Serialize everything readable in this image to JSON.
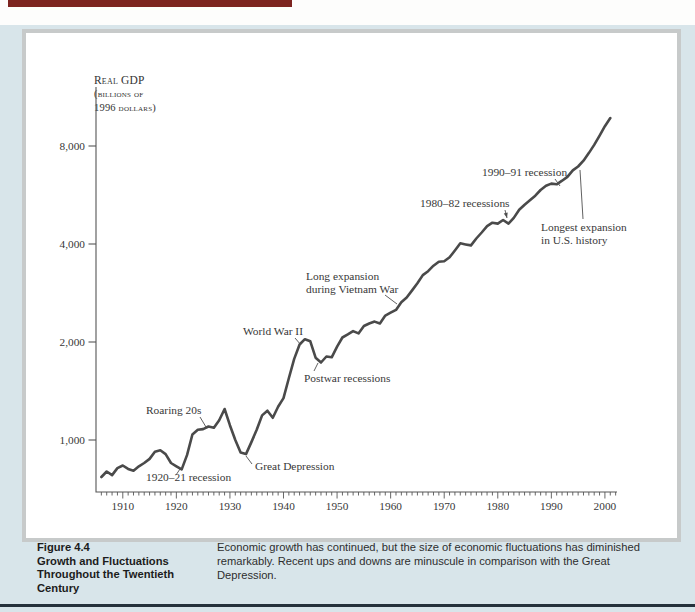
{
  "page": {
    "top_bar_color": "#7d2420",
    "panel_background_color": "#d8e5ea",
    "chart_box_border_color": "#c7caca",
    "bottom_rule_color": "#25313b",
    "curve_color": "#4a4a4a"
  },
  "figure_caption": {
    "label": "Figure 4.4",
    "title_lines": [
      "Growth and Fluctuations",
      "Throughout the Twentieth",
      "Century"
    ],
    "body": "Economic growth has continued, but the size of economic fluctuations has diminished remarkably. Recent ups and downs are minuscule in comparison with the Great Depression."
  },
  "chart_data": {
    "type": "line",
    "ylabel_lines": [
      "Real GDP",
      "(billions of",
      "1996 dollars)"
    ],
    "xlabel": "",
    "y_scale": "log",
    "y_ticks": [
      1000,
      2000,
      4000,
      8000
    ],
    "y_tick_labels": [
      "1,000",
      "2,000",
      "4,000",
      "8,000"
    ],
    "x_ticks": [
      1910,
      1920,
      1930,
      1940,
      1950,
      1960,
      1970,
      1980,
      1990,
      2000
    ],
    "x_range": [
      1905,
      2002
    ],
    "grid": "off",
    "legend": "none",
    "series": [
      {
        "name": "Real GDP (billions of 1996 dollars)",
        "points": [
          [
            1906,
            770
          ],
          [
            1907,
            800
          ],
          [
            1908,
            780
          ],
          [
            1909,
            820
          ],
          [
            1910,
            835
          ],
          [
            1911,
            815
          ],
          [
            1912,
            805
          ],
          [
            1913,
            830
          ],
          [
            1914,
            850
          ],
          [
            1915,
            875
          ],
          [
            1916,
            920
          ],
          [
            1917,
            930
          ],
          [
            1918,
            905
          ],
          [
            1919,
            850
          ],
          [
            1920,
            830
          ],
          [
            1921,
            812
          ],
          [
            1922,
            900
          ],
          [
            1923,
            1040
          ],
          [
            1924,
            1075
          ],
          [
            1925,
            1080
          ],
          [
            1926,
            1100
          ],
          [
            1927,
            1090
          ],
          [
            1928,
            1150
          ],
          [
            1929,
            1245
          ],
          [
            1930,
            1110
          ],
          [
            1931,
            1000
          ],
          [
            1932,
            915
          ],
          [
            1933,
            905
          ],
          [
            1934,
            985
          ],
          [
            1935,
            1075
          ],
          [
            1936,
            1190
          ],
          [
            1937,
            1230
          ],
          [
            1938,
            1170
          ],
          [
            1939,
            1265
          ],
          [
            1940,
            1345
          ],
          [
            1941,
            1550
          ],
          [
            1942,
            1775
          ],
          [
            1943,
            1965
          ],
          [
            1944,
            2040
          ],
          [
            1945,
            2010
          ],
          [
            1946,
            1790
          ],
          [
            1947,
            1730
          ],
          [
            1948,
            1805
          ],
          [
            1949,
            1795
          ],
          [
            1950,
            1935
          ],
          [
            1951,
            2065
          ],
          [
            1952,
            2110
          ],
          [
            1953,
            2160
          ],
          [
            1954,
            2125
          ],
          [
            1955,
            2240
          ],
          [
            1956,
            2280
          ],
          [
            1957,
            2310
          ],
          [
            1958,
            2280
          ],
          [
            1959,
            2410
          ],
          [
            1960,
            2460
          ],
          [
            1961,
            2510
          ],
          [
            1962,
            2650
          ],
          [
            1963,
            2740
          ],
          [
            1964,
            2880
          ],
          [
            1965,
            3030
          ],
          [
            1966,
            3210
          ],
          [
            1967,
            3300
          ],
          [
            1968,
            3430
          ],
          [
            1969,
            3530
          ],
          [
            1970,
            3540
          ],
          [
            1971,
            3640
          ],
          [
            1972,
            3820
          ],
          [
            1973,
            4020
          ],
          [
            1974,
            3990
          ],
          [
            1975,
            3960
          ],
          [
            1976,
            4160
          ],
          [
            1977,
            4340
          ],
          [
            1978,
            4540
          ],
          [
            1979,
            4650
          ],
          [
            1980,
            4620
          ],
          [
            1981,
            4740
          ],
          [
            1982,
            4620
          ],
          [
            1983,
            4810
          ],
          [
            1984,
            5100
          ],
          [
            1985,
            5280
          ],
          [
            1986,
            5450
          ],
          [
            1987,
            5630
          ],
          [
            1988,
            5860
          ],
          [
            1989,
            6040
          ],
          [
            1990,
            6130
          ],
          [
            1991,
            6100
          ],
          [
            1992,
            6260
          ],
          [
            1993,
            6430
          ],
          [
            1994,
            6730
          ],
          [
            1995,
            6920
          ],
          [
            1996,
            7210
          ],
          [
            1997,
            7610
          ],
          [
            1998,
            8060
          ],
          [
            1999,
            8610
          ],
          [
            2000,
            9200
          ],
          [
            2001,
            9750
          ]
        ]
      }
    ],
    "annotations": [
      {
        "label": "1920–21 recession",
        "lines": [
          "1920–21 recession"
        ],
        "x": 146,
        "y": 481,
        "pointer": [
          176,
          475,
          180,
          469
        ],
        "arrow": false
      },
      {
        "label": "Roaring 20s",
        "lines": [
          "Roaring 20s"
        ],
        "x": 146,
        "y": 414,
        "pointer": [
          200,
          417,
          206,
          427
        ],
        "arrow": false
      },
      {
        "label": "Great Depression",
        "lines": [
          "Great Depression"
        ],
        "x": 255,
        "y": 470,
        "pointer": [
          252,
          464,
          246,
          456
        ],
        "arrow": false
      },
      {
        "label": "World War II",
        "lines": [
          "World War II"
        ],
        "x": 243,
        "y": 335,
        "pointer": [
          295,
          338,
          301,
          345
        ],
        "arrow": false
      },
      {
        "label": "Postwar recessions",
        "lines": [
          "Postwar recessions"
        ],
        "x": 304,
        "y": 382,
        "pointer": [
          314,
          371,
          318,
          363
        ],
        "arrow": false
      },
      {
        "label": "Long expansion during Vietnam War",
        "lines": [
          "Long expansion",
          "during Vietnam War"
        ],
        "x": 306,
        "y": 280,
        "pointer": [
          385,
          295,
          397,
          304
        ],
        "arrow": false
      },
      {
        "label": "1980–82 recessions",
        "lines": [
          "1980–82 recessions"
        ],
        "x": 420,
        "y": 207,
        "pointer": [
          505,
          210,
          507,
          218
        ],
        "arrow": true
      },
      {
        "label": "1990–91 recession",
        "lines": [
          "1990–91 recession"
        ],
        "x": 482,
        "y": 176,
        "pointer": [
          555,
          179,
          560,
          186
        ],
        "arrow": false
      },
      {
        "label": "Longest expansion in U.S. history",
        "lines": [
          "Longest expansion",
          "in U.S. history"
        ],
        "x": 541,
        "y": 231,
        "pointer": [
          583,
          219,
          580,
          170
        ],
        "arrow": false
      }
    ]
  }
}
